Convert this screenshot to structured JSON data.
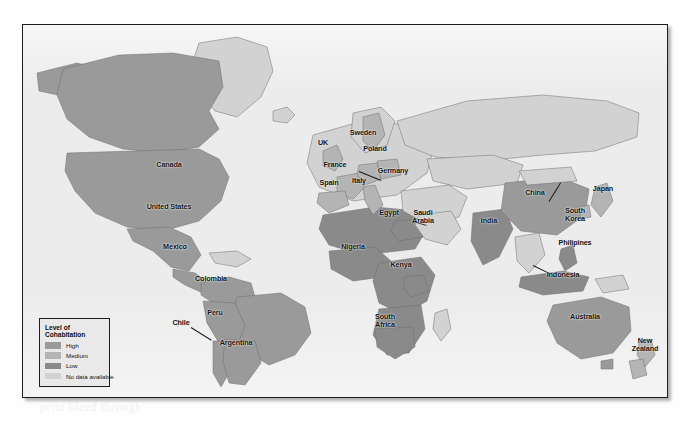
{
  "figure": {
    "type": "choropleth-world-map",
    "legend": {
      "title": "Level of Cohabitation",
      "entries": [
        {
          "label": "High",
          "color": "#9a9a9a"
        },
        {
          "label": "Medium",
          "color": "#b4b4b4"
        },
        {
          "label": "Low",
          "color": "#8a8a8a"
        },
        {
          "label": "No data available",
          "color": "#d2d2d2"
        }
      ]
    },
    "labels": [
      {
        "name": "Canada",
        "text": "Canada",
        "x": 146,
        "y": 140
      },
      {
        "name": "United States",
        "text": "United States",
        "x": 146,
        "y": 182
      },
      {
        "name": "Mexico",
        "text": "Mexico",
        "x": 152,
        "y": 222
      },
      {
        "name": "Colombia",
        "text": "Colombia",
        "x": 188,
        "y": 254
      },
      {
        "name": "Peru",
        "text": "Peru",
        "x": 192,
        "y": 288
      },
      {
        "name": "Chile",
        "text": "Chile",
        "x": 178,
        "y": 322
      },
      {
        "name": "Argentina",
        "text": "Argentina",
        "x": 213,
        "y": 338
      },
      {
        "name": "UK",
        "text": "UK",
        "x": 316,
        "y": 141
      },
      {
        "name": "Sweden",
        "text": "Sweden",
        "x": 352,
        "y": 132
      },
      {
        "name": "Poland",
        "text": "Poland",
        "x": 359,
        "y": 148
      },
      {
        "name": "Germany",
        "text": "Germany",
        "x": 360,
        "y": 160
      },
      {
        "name": "France",
        "text": "France",
        "x": 327,
        "y": 159
      },
      {
        "name": "Spain",
        "text": "Spain",
        "x": 320,
        "y": 181
      },
      {
        "name": "Italy",
        "text": "Italy",
        "x": 348,
        "y": 179
      },
      {
        "name": "Egypt",
        "text": "Egypt",
        "x": 379,
        "y": 210
      },
      {
        "name": "Saudi Arabia",
        "text": "Saudi\nArabia",
        "x": 405,
        "y": 213
      },
      {
        "name": "Nigeria",
        "text": "Nigeria",
        "x": 344,
        "y": 243
      },
      {
        "name": "Kenya",
        "text": "Kenya",
        "x": 389,
        "y": 262
      },
      {
        "name": "South Africa",
        "text": "South\nAfrica",
        "x": 373,
        "y": 318
      },
      {
        "name": "India",
        "text": "India",
        "x": 462,
        "y": 218
      },
      {
        "name": "China",
        "text": "China",
        "x": 508,
        "y": 190
      },
      {
        "name": "Japan",
        "text": "Japan",
        "x": 572,
        "y": 186
      },
      {
        "name": "South Korea",
        "text": "South\nKorea",
        "x": 551,
        "y": 209
      },
      {
        "name": "Philipines",
        "text": "Philipines",
        "x": 546,
        "y": 239
      },
      {
        "name": "Indonesia",
        "text": "Indonesia",
        "x": 538,
        "y": 271
      },
      {
        "name": "Australia",
        "text": "Australia",
        "x": 571,
        "y": 312
      },
      {
        "name": "New Zealand",
        "text": "New\nZealand",
        "x": 632,
        "y": 345
      }
    ],
    "bleed_text": [
      {
        "text": "the hidden page showing through",
        "x": 30,
        "y": 206
      },
      {
        "text": "faint reverse side type",
        "x": 300,
        "y": 230
      },
      {
        "text": "ALTERNATIVE FORMS OF FAMILIES",
        "x": 352,
        "y": 372
      },
      {
        "text": "print bleed through",
        "x": 40,
        "y": 404
      }
    ]
  }
}
